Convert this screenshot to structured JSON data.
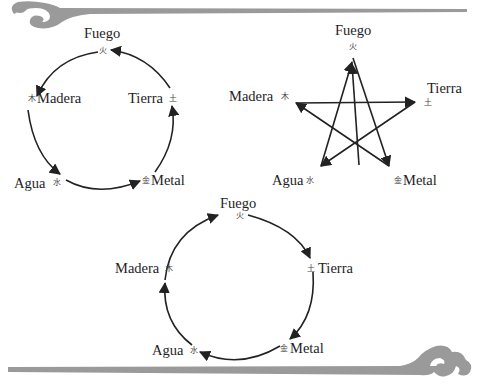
{
  "diagrams": [
    {
      "id": "generating-cycle",
      "type": "circle",
      "nodes": [
        {
          "key": "fire",
          "label": "Fuego",
          "glyph": "火"
        },
        {
          "key": "wood",
          "label": "Madera",
          "glyph": "木"
        },
        {
          "key": "earth",
          "label": "Tierra",
          "glyph": "土"
        },
        {
          "key": "water",
          "label": "Agua",
          "glyph": "水"
        },
        {
          "key": "metal",
          "label": "Metal",
          "glyph": "金"
        }
      ],
      "edges": [
        {
          "from": "fire",
          "to": "wood"
        },
        {
          "from": "wood",
          "to": "water"
        },
        {
          "from": "water",
          "to": "metal"
        },
        {
          "from": "metal",
          "to": "earth"
        },
        {
          "from": "earth",
          "to": "fire"
        }
      ]
    },
    {
      "id": "star-cycle",
      "type": "pentagram",
      "nodes": [
        {
          "key": "fire",
          "label": "Fuego",
          "glyph": "火"
        },
        {
          "key": "wood",
          "label": "Madera",
          "glyph": "木"
        },
        {
          "key": "earth",
          "label": "Tierra",
          "glyph": "土"
        },
        {
          "key": "water",
          "label": "Agua",
          "glyph": "水"
        },
        {
          "key": "metal",
          "label": "Metal",
          "glyph": "金"
        }
      ],
      "edges": [
        {
          "from": "water",
          "to": "fire"
        },
        {
          "from": "fire",
          "to": "metal"
        },
        {
          "from": "metal",
          "to": "wood"
        },
        {
          "from": "wood",
          "to": "earth"
        },
        {
          "from": "earth",
          "to": "water"
        }
      ]
    },
    {
      "id": "second-circle",
      "type": "circle",
      "nodes": [
        {
          "key": "fire",
          "label": "Fuego",
          "glyph": "火"
        },
        {
          "key": "wood",
          "label": "Madera",
          "glyph": "木"
        },
        {
          "key": "earth",
          "label": "Tierra",
          "glyph": "土"
        },
        {
          "key": "water",
          "label": "Agua",
          "glyph": "水"
        },
        {
          "key": "metal",
          "label": "Metal",
          "glyph": "金"
        }
      ],
      "edges": [
        {
          "from": "fire",
          "to": "earth"
        },
        {
          "from": "earth",
          "to": "metal"
        },
        {
          "from": "metal",
          "to": "water"
        },
        {
          "from": "water",
          "to": "wood"
        },
        {
          "from": "wood",
          "to": "fire"
        }
      ]
    }
  ],
  "colors": {
    "ink": "#222222",
    "ornament": "#9a9a9a",
    "background": "#ffffff"
  }
}
